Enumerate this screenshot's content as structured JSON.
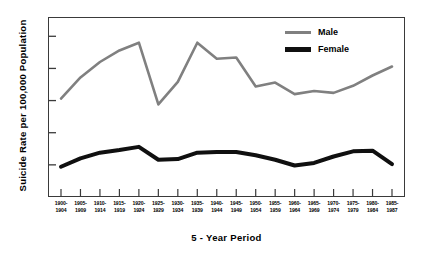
{
  "chart_data": {
    "type": "line",
    "title": "",
    "xlabel": "5-Year Period",
    "ylabel": "Suicide Rate per 100,000 Population",
    "ylim": [
      0,
      28
    ],
    "yticks": [
      5,
      10,
      15,
      20,
      25
    ],
    "grid": false,
    "legend_position": "top-right",
    "categories": [
      "1900-1904",
      "1905-1909",
      "1910-1914",
      "1915-1919",
      "1920-1924",
      "1925-1929",
      "1930-1934",
      "1935-1939",
      "1940-1944",
      "1945-1949",
      "1950-1954",
      "1955-1959",
      "1960-1964",
      "1965-1969",
      "1970-1974",
      "1975-1979",
      "1980-1984",
      "1985-1987"
    ],
    "categories_split": [
      {
        "start": "1900-",
        "end": "1904"
      },
      {
        "start": "1905-",
        "end": "1909"
      },
      {
        "start": "1910-",
        "end": "1914"
      },
      {
        "start": "1915-",
        "end": "1919"
      },
      {
        "start": "1920-",
        "end": "1924"
      },
      {
        "start": "1925-",
        "end": "1929"
      },
      {
        "start": "1930-",
        "end": "1934"
      },
      {
        "start": "1935-",
        "end": "1939"
      },
      {
        "start": "1940-",
        "end": "1944"
      },
      {
        "start": "1945-",
        "end": "1949"
      },
      {
        "start": "1950-",
        "end": "1954"
      },
      {
        "start": "1955-",
        "end": "1959"
      },
      {
        "start": "1960-",
        "end": "1964"
      },
      {
        "start": "1965-",
        "end": "1969"
      },
      {
        "start": "1970-",
        "end": "1974"
      },
      {
        "start": "1975-",
        "end": "1979"
      },
      {
        "start": "1980-",
        "end": "1984"
      },
      {
        "start": "1985-",
        "end": "1987"
      }
    ],
    "series": [
      {
        "name": "Male",
        "color": "#808080",
        "width": 2.6,
        "values": [
          15.3,
          18.6,
          21.0,
          22.8,
          24.0,
          14.4,
          17.9,
          24.0,
          21.5,
          21.7,
          17.2,
          17.8,
          16.0,
          16.5,
          16.2,
          17.3,
          18.9,
          18.7
        ]
      },
      {
        "name": "Female",
        "color": "#101010",
        "width": 4.0,
        "values": [
          4.7,
          6.0,
          6.9,
          7.3,
          7.8,
          5.8,
          5.9,
          6.9,
          7.0,
          7.0,
          6.5,
          5.8,
          4.9,
          5.3,
          6.3,
          7.1,
          7.2,
          6.2
        ]
      }
    ],
    "series_tail_values": {
      "Male": 20.3,
      "Female": 5.1
    }
  },
  "legend": {
    "items": [
      {
        "label": "Male",
        "color": "#808080"
      },
      {
        "label": "Female",
        "color": "#101010"
      }
    ]
  },
  "axes": {
    "y_title": "Suicide Rate per 100,000 Population",
    "x_title": "5 - Year Period",
    "y_tick_labels": [
      "25",
      "20",
      "15",
      "10",
      "5"
    ]
  }
}
